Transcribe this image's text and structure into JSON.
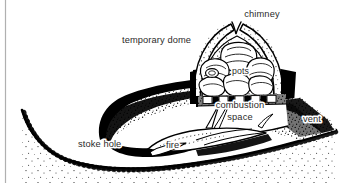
{
  "figure": {
    "background_color": "#ffffff",
    "ink_color": "#000000",
    "label_color": "#2b2b2b",
    "rule_color": "#b0b0b0"
  },
  "labels": {
    "chimney": "chimney",
    "temporary_dome": "temporary dome",
    "pots": "pots",
    "combustion": "combustion",
    "space": "space",
    "vent": "vent",
    "stoke_hole": "stoke hole",
    "fire": "fire"
  }
}
